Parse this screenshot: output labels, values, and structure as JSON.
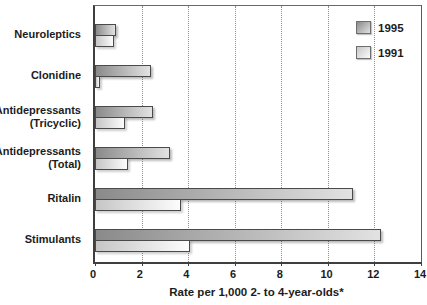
{
  "chart_data": {
    "type": "bar",
    "orientation": "horizontal",
    "title": "",
    "xlabel": "Rate per 1,000 2- to 4-year-olds*",
    "ylabel": "",
    "xlim": [
      0,
      14
    ],
    "xticks": [
      0,
      2,
      4,
      6,
      8,
      10,
      12,
      14
    ],
    "grid": "vertical-dotted",
    "legend_position": "top-right-inside",
    "categories": [
      "Neuroleptics",
      "Clonidine",
      "Antidepressants (Tricyclic)",
      "Antidepressants (Total)",
      "Ritalin",
      "Stimulants"
    ],
    "category_label_lines": [
      [
        "Neuroleptics"
      ],
      [
        "Clonidine"
      ],
      [
        "Antidepressants",
        "(Tricyclic)"
      ],
      [
        "Antidepressants",
        "(Total)"
      ],
      [
        "Ritalin"
      ],
      [
        "Stimulants"
      ]
    ],
    "series": [
      {
        "name": "1995",
        "values": [
          0.9,
          2.4,
          2.5,
          3.2,
          11.1,
          12.3
        ]
      },
      {
        "name": "1991",
        "values": [
          0.8,
          0.2,
          1.3,
          1.4,
          3.7,
          4.1
        ]
      }
    ]
  },
  "style": {
    "bar_1995_color_start": "#8a8a8a",
    "bar_1995_color_end": "#e2e2e2",
    "bar_1991_color_start": "#c6c6c6",
    "bar_1991_color_end": "#fcfcfc",
    "bar_border_color": "#4a4a4a",
    "grid_color": "#8f8f8f",
    "text_color": "#1c1c1c",
    "background": "#ffffff"
  }
}
